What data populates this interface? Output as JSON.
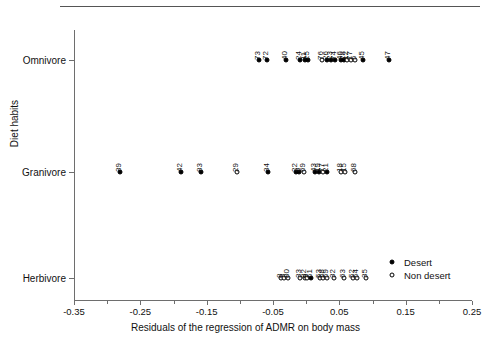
{
  "chart_data": {
    "type": "scatter",
    "title": "",
    "xlabel": "Residuals of the regression of ADMR on body mass",
    "ylabel": "Diet habits",
    "xlim": [
      -0.35,
      0.25
    ],
    "xticks": [
      -0.35,
      -0.25,
      -0.15,
      -0.05,
      0.05,
      0.15,
      0.25
    ],
    "xticklabels": [
      "-0.35",
      "-0.25",
      "-0.15",
      "-0.05",
      "0.05",
      "0.15",
      "0.25"
    ],
    "categories": [
      "Omnivore",
      "Granivore",
      "Herbivore"
    ],
    "grid": false,
    "legend_position": "bottom-right",
    "legend": [
      {
        "key": "desert",
        "label": "Desert",
        "marker": "filled-circle"
      },
      {
        "key": "nondesert",
        "label": "Non desert",
        "marker": "open-circle"
      }
    ],
    "series": [
      {
        "name": "Omnivore",
        "category": "Omnivore",
        "points": [
          {
            "label": "73",
            "x": -0.071,
            "group": "desert"
          },
          {
            "label": "72",
            "x": -0.059,
            "group": "desert"
          },
          {
            "label": "40",
            "x": -0.03,
            "group": "desert"
          },
          {
            "label": "24",
            "x": -0.009,
            "group": "desert"
          },
          {
            "label": "11",
            "x": -0.002,
            "group": "desert"
          },
          {
            "label": "25",
            "x": 0.003,
            "group": "desert"
          },
          {
            "label": "76",
            "x": 0.024,
            "group": "nondesert"
          },
          {
            "label": "26",
            "x": 0.031,
            "group": "desert"
          },
          {
            "label": "23",
            "x": 0.037,
            "group": "desert"
          },
          {
            "label": "74",
            "x": 0.043,
            "group": "desert"
          },
          {
            "label": "46",
            "x": 0.052,
            "group": "desert"
          },
          {
            "label": "28",
            "x": 0.057,
            "group": "desert"
          },
          {
            "label": "12",
            "x": 0.062,
            "group": "nondesert"
          },
          {
            "label": "77",
            "x": 0.067,
            "group": "nondesert"
          },
          {
            "label": "5",
            "x": 0.073,
            "group": "nondesert"
          },
          {
            "label": "45",
            "x": 0.086,
            "group": "desert"
          },
          {
            "label": "47",
            "x": 0.125,
            "group": "desert"
          }
        ]
      },
      {
        "name": "Granivore",
        "category": "Granivore",
        "points": [
          {
            "label": "39",
            "x": -0.281,
            "group": "desert"
          },
          {
            "label": "42",
            "x": -0.188,
            "group": "desert"
          },
          {
            "label": "83",
            "x": -0.159,
            "group": "desert"
          },
          {
            "label": "29",
            "x": -0.104,
            "group": "nondesert"
          },
          {
            "label": "34",
            "x": -0.058,
            "group": "desert"
          },
          {
            "label": "22",
            "x": -0.016,
            "group": "desert"
          },
          {
            "label": "8",
            "x": -0.011,
            "group": "desert"
          },
          {
            "label": "69",
            "x": -0.003,
            "group": "nondesert"
          },
          {
            "label": "43",
            "x": 0.013,
            "group": "desert"
          },
          {
            "label": "19",
            "x": 0.019,
            "group": "desert"
          },
          {
            "label": "77",
            "x": 0.025,
            "group": "nondesert"
          },
          {
            "label": "21",
            "x": 0.031,
            "group": "desert"
          },
          {
            "label": "18",
            "x": 0.053,
            "group": "nondesert"
          },
          {
            "label": "15",
            "x": 0.059,
            "group": "nondesert"
          },
          {
            "label": "68",
            "x": 0.073,
            "group": "nondesert"
          }
        ]
      },
      {
        "name": "Herbivore",
        "category": "Herbivore",
        "points": [
          {
            "label": "8",
            "x": -0.038,
            "group": "nondesert"
          },
          {
            "label": "3",
            "x": -0.033,
            "group": "nondesert"
          },
          {
            "label": "80",
            "x": -0.028,
            "group": "nondesert"
          },
          {
            "label": "33",
            "x": -0.009,
            "group": "nondesert"
          },
          {
            "label": "82",
            "x": -0.002,
            "group": "nondesert"
          },
          {
            "label": "9",
            "x": 0.002,
            "group": "nondesert"
          },
          {
            "label": "51",
            "x": 0.007,
            "group": "desert"
          },
          {
            "label": "53",
            "x": 0.021,
            "group": "nondesert"
          },
          {
            "label": "58",
            "x": 0.026,
            "group": "nondesert"
          },
          {
            "label": "59",
            "x": 0.031,
            "group": "nondesert"
          },
          {
            "label": "32",
            "x": 0.042,
            "group": "nondesert"
          },
          {
            "label": "63",
            "x": 0.057,
            "group": "nondesert"
          },
          {
            "label": "52",
            "x": 0.071,
            "group": "nondesert"
          },
          {
            "label": "54",
            "x": 0.076,
            "group": "nondesert"
          },
          {
            "label": "35",
            "x": 0.09,
            "group": "nondesert"
          }
        ]
      }
    ],
    "label_groups": {
      "Omnivore": [
        "73",
        "72",
        "40",
        "24",
        "1125",
        "76",
        "26",
        "23",
        "74",
        "46",
        "2812775",
        "45",
        "47"
      ],
      "Granivore": [
        "39",
        "42",
        "83",
        "29",
        "34",
        "228",
        "69",
        "431977",
        "21",
        "1815",
        "68"
      ],
      "Herbivore": [
        "8 3BO",
        "33",
        "82951",
        "535859",
        "32",
        "63",
        "8 5254",
        "35"
      ]
    }
  },
  "colors": {
    "axis": "#6e6e6e",
    "text": "#111111",
    "marker_fill_desert": "#000000",
    "marker_fill_nondesert": "#ffffff",
    "marker_stroke": "#000000",
    "background": "#ffffff"
  }
}
